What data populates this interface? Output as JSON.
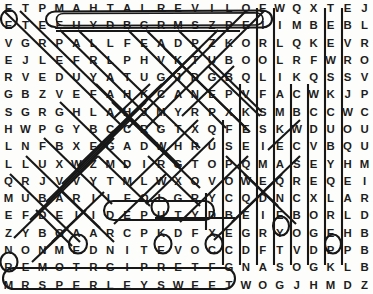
{
  "puzzle": {
    "type": "word-search",
    "columns": 22,
    "rows": 17,
    "ink_color": "#171717",
    "letter_color": "#1d1d1d",
    "background_color": "#fdfdfb",
    "grid": [
      [
        "E",
        "T",
        "P",
        "M",
        "A",
        "H",
        "T",
        "A",
        "L",
        "R",
        "E",
        "V",
        "I",
        "L",
        "O",
        "E",
        "W",
        "Q",
        "X",
        "T",
        "E",
        "J"
      ],
      [
        "E",
        "T",
        "E",
        "E",
        "U",
        "Y",
        "D",
        "B",
        "G",
        "R",
        "M",
        "S",
        "Z",
        "P",
        "E",
        "I",
        "I",
        "M",
        "B",
        "E",
        "B",
        "L"
      ],
      [
        "V",
        "G",
        "R",
        "P",
        "A",
        "L",
        "L",
        "F",
        "E",
        "A",
        "D",
        "P",
        "Z",
        "K",
        "O",
        "R",
        "L",
        "Q",
        "K",
        "E",
        "V",
        "R"
      ],
      [
        "E",
        "J",
        "L",
        "E",
        "F",
        "R",
        "L",
        "P",
        "H",
        "V",
        "K",
        "T",
        "U",
        "B",
        "O",
        "O",
        "L",
        "R",
        "F",
        "W",
        "R",
        "O"
      ],
      [
        "R",
        "V",
        "E",
        "D",
        "U",
        "Y",
        "A",
        "T",
        "U",
        "G",
        "J",
        "D",
        "G",
        "B",
        "Q",
        "L",
        "I",
        "K",
        "Q",
        "S",
        "S",
        "V"
      ],
      [
        "G",
        "B",
        "Z",
        "V",
        "E",
        "F",
        "A",
        "H",
        "K",
        "C",
        "A",
        "N",
        "E",
        "P",
        "V",
        "F",
        "A",
        "C",
        "W",
        "K",
        "J",
        "P"
      ],
      [
        "S",
        "G",
        "R",
        "G",
        "H",
        "L",
        "A",
        "H",
        "J",
        "M",
        "Y",
        "R",
        "P",
        "X",
        "K",
        "S",
        "M",
        "B",
        "C",
        "C",
        "W",
        "C"
      ],
      [
        "H",
        "W",
        "P",
        "G",
        "Y",
        "B",
        "C",
        "C",
        "R",
        "G",
        "T",
        "X",
        "Q",
        "F",
        "E",
        "S",
        "K",
        "W",
        "D",
        "U",
        "O",
        "U"
      ],
      [
        "L",
        "N",
        "F",
        "B",
        "X",
        "E",
        "G",
        "A",
        "D",
        "W",
        "H",
        "R",
        "U",
        "S",
        "E",
        "I",
        "E",
        "C",
        "V",
        "B",
        "Q",
        "U"
      ],
      [
        "L",
        "L",
        "U",
        "X",
        "W",
        "Z",
        "M",
        "D",
        "I",
        "R",
        "G",
        "T",
        "O",
        "P",
        "Q",
        "M",
        "A",
        "S",
        "E",
        "Y",
        "H",
        "M"
      ],
      [
        "Q",
        "R",
        "J",
        "V",
        "V",
        "Y",
        "T",
        "M",
        "L",
        "W",
        "X",
        "O",
        "V",
        "O",
        "W",
        "E",
        "Q",
        "R",
        "E",
        "Q",
        "E",
        "I"
      ],
      [
        "M",
        "U",
        "B",
        "A",
        "R",
        "I",
        "L",
        "F",
        "O",
        "L",
        "G",
        "R",
        "Y",
        "C",
        "Q",
        "D",
        "N",
        "C",
        "X",
        "L",
        "A",
        "R"
      ],
      [
        "E",
        "F",
        "D",
        "E",
        "I",
        "I",
        "D",
        "E",
        "P",
        "U",
        "T",
        "Y",
        "D",
        "B",
        "E",
        "I",
        "E",
        "B",
        "O",
        "R",
        "L",
        "D"
      ],
      [
        "Z",
        "Y",
        "B",
        "G",
        "A",
        "A",
        "R",
        "C",
        "P",
        "K",
        "D",
        "F",
        "X",
        "E",
        "G",
        "R",
        "Y",
        "O",
        "G",
        "E",
        "H",
        "B"
      ],
      [
        "N",
        "O",
        "N",
        "M",
        "E",
        "D",
        "N",
        "I",
        "T",
        "E",
        "V",
        "O",
        "C",
        "C",
        "D",
        "F",
        "T",
        "V",
        "D",
        "P",
        "P",
        "B"
      ],
      [
        "R",
        "E",
        "M",
        "O",
        "T",
        "R",
        "G",
        "I",
        "P",
        "R",
        "E",
        "T",
        "F",
        "G",
        "N",
        "A",
        "S",
        "O",
        "G",
        "K",
        "L",
        "B"
      ],
      [
        "M",
        "R",
        "S",
        "P",
        "E",
        "R",
        "L",
        "E",
        "Y",
        "S",
        "W",
        "E",
        "E",
        "T",
        "W",
        "O",
        "G",
        "J",
        "H",
        "M",
        "D",
        "Z"
      ]
    ],
    "circled_words": [
      {
        "text": "MAHTALREVILO",
        "row": 0,
        "col_start": 3,
        "col_end": 15,
        "note": "OLIVERLATHAM reversed"
      },
      {
        "text": "DEPUTY",
        "row": 12,
        "col_start": 6,
        "col_end": 11
      },
      {
        "text": "MRSPERLEYSWEET",
        "row": 16,
        "col_start": 0,
        "col_end": 13
      }
    ]
  }
}
